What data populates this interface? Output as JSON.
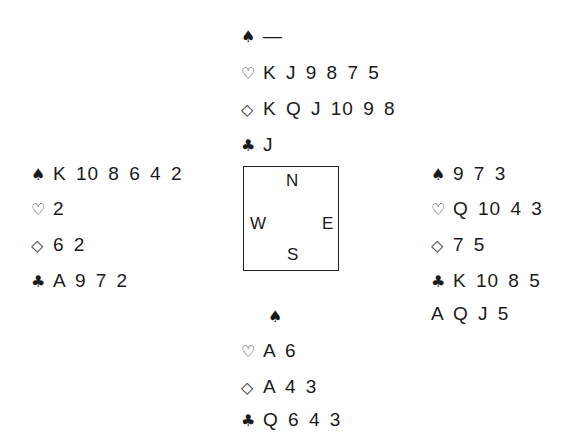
{
  "north": {
    "spades": "—",
    "hearts": "K J 9 8 7 5",
    "diamonds": "K Q J 10 9 8",
    "clubs": "J"
  },
  "west": {
    "spades": "K 10 8 6 4 2",
    "hearts": "2",
    "diamonds": "6 2",
    "clubs": "A 9 7 2"
  },
  "east": {
    "spades": "9 7 3",
    "hearts": "Q 10 4 3",
    "diamonds": "7 5",
    "clubs": "K 10 8 5",
    "extra": "A Q J 5"
  },
  "south": {
    "spades": "",
    "hearts": "A 6",
    "diamonds": "A 4 3",
    "clubs": "Q 6 4 3"
  },
  "compass": {
    "n": "N",
    "s": "S",
    "e": "E",
    "w": "W"
  },
  "icons": {
    "spade": "♠",
    "heart": "♡",
    "diamond": "◇",
    "club": "♣"
  }
}
